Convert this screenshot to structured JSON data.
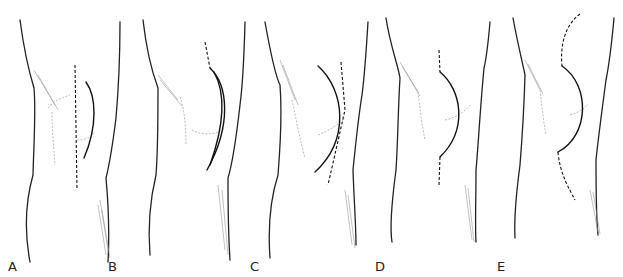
{
  "figure": {
    "panels": [
      {
        "label": "A",
        "incision": "straight midline (dashed) with lateral parapatellar curve"
      },
      {
        "label": "B",
        "incision": "lateral parapatellar curved"
      },
      {
        "label": "C",
        "incision": "curved lateral with straight dashed line"
      },
      {
        "label": "D",
        "incision": "medial parapatellar curved with dashed extensions"
      },
      {
        "label": "E",
        "incision": "long curved medial with dashed extensions"
      }
    ]
  }
}
